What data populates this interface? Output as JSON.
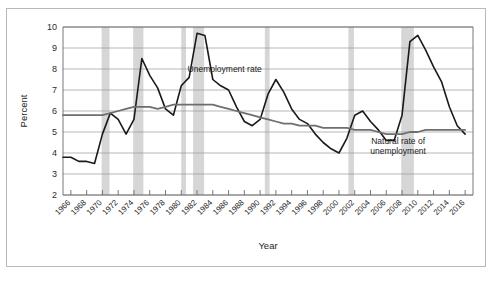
{
  "chart_data": {
    "type": "line",
    "title": "",
    "xlabel": "Year",
    "ylabel": "Percent",
    "ylim": [
      2,
      10
    ],
    "xlim": [
      1965,
      2017
    ],
    "ytick_labels": [
      "2",
      "3",
      "4",
      "5",
      "6",
      "7",
      "8",
      "9",
      "10"
    ],
    "yticks": [
      2,
      3,
      4,
      5,
      6,
      7,
      8,
      9,
      10
    ],
    "grid": true,
    "legend_position": "inline-annotations",
    "xtick_labels": [
      "1966",
      "1968",
      "1970",
      "1972",
      "1974",
      "1976",
      "1978",
      "1980",
      "1982",
      "1984",
      "1986",
      "1988",
      "1990",
      "1992",
      "1994",
      "1996",
      "1998",
      "2000",
      "2002",
      "2004",
      "2006",
      "2008",
      "2010",
      "2012",
      "2014",
      "2016"
    ],
    "xticks": [
      1966,
      1968,
      1970,
      1972,
      1974,
      1976,
      1978,
      1980,
      1982,
      1984,
      1986,
      1988,
      1990,
      1992,
      1994,
      1996,
      1998,
      2000,
      2002,
      2004,
      2006,
      2008,
      2010,
      2012,
      2014,
      2016
    ],
    "x": [
      1965,
      1966,
      1967,
      1968,
      1969,
      1970,
      1971,
      1972,
      1973,
      1974,
      1975,
      1976,
      1977,
      1978,
      1979,
      1980,
      1981,
      1982,
      1983,
      1984,
      1985,
      1986,
      1987,
      1988,
      1989,
      1990,
      1991,
      1992,
      1993,
      1994,
      1995,
      1996,
      1997,
      1998,
      1999,
      2000,
      2001,
      2002,
      2003,
      2004,
      2005,
      2006,
      2007,
      2008,
      2009,
      2010,
      2011,
      2012,
      2013,
      2014,
      2015,
      2016
    ],
    "series": [
      {
        "name": "Unemployment rate",
        "color": "#1a1a1a",
        "values": [
          3.8,
          3.8,
          3.6,
          3.6,
          3.5,
          4.9,
          5.9,
          5.6,
          4.9,
          5.6,
          8.5,
          7.7,
          7.1,
          6.1,
          5.8,
          7.2,
          7.6,
          9.7,
          9.6,
          7.5,
          7.2,
          7.0,
          6.2,
          5.5,
          5.3,
          5.6,
          6.8,
          7.5,
          6.9,
          6.1,
          5.6,
          5.4,
          4.9,
          4.5,
          4.2,
          4.0,
          4.7,
          5.8,
          6.0,
          5.5,
          5.1,
          4.6,
          4.6,
          5.8,
          9.3,
          9.6,
          8.9,
          8.1,
          7.4,
          6.2,
          5.3,
          4.9
        ]
      },
      {
        "name": "Natural rate of unemployment",
        "color": "#6e6e6e",
        "values": [
          5.8,
          5.8,
          5.8,
          5.8,
          5.8,
          5.8,
          5.9,
          6.0,
          6.1,
          6.2,
          6.2,
          6.2,
          6.1,
          6.2,
          6.3,
          6.3,
          6.3,
          6.3,
          6.3,
          6.3,
          6.2,
          6.1,
          6.0,
          5.9,
          5.8,
          5.7,
          5.6,
          5.5,
          5.4,
          5.4,
          5.3,
          5.3,
          5.3,
          5.2,
          5.2,
          5.2,
          5.2,
          5.1,
          5.1,
          5.1,
          5.0,
          4.9,
          4.9,
          4.9,
          5.0,
          5.0,
          5.1,
          5.1,
          5.1,
          5.1,
          5.1,
          5.1
        ]
      }
    ],
    "recession_bands": [
      {
        "start": 1969.9,
        "end": 1970.9
      },
      {
        "start": 1973.9,
        "end": 1975.2
      },
      {
        "start": 1980.0,
        "end": 1980.6
      },
      {
        "start": 1981.5,
        "end": 1982.9
      },
      {
        "start": 1990.6,
        "end": 1991.2
      },
      {
        "start": 2001.2,
        "end": 2001.9
      },
      {
        "start": 2007.9,
        "end": 2009.5
      }
    ],
    "recession_band_color": "#d6d6d6",
    "annotations": [
      {
        "name": "unemployment-rate-annotation",
        "text": "Unemployment rate",
        "x": 1985.5,
        "y": 7.85
      },
      {
        "name": "natural-rate-annotation-line1",
        "text": "Natural rate of",
        "x": 2007.5,
        "y": 4.45
      },
      {
        "name": "natural-rate-annotation-line2",
        "text": "unemployment",
        "x": 2007.5,
        "y": 3.95
      }
    ]
  }
}
